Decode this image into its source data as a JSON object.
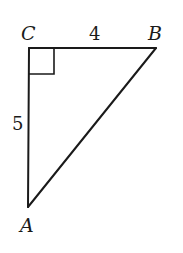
{
  "figure": {
    "type": "right-triangle",
    "colors": {
      "stroke": "#1a1a1a",
      "background": "#ffffff"
    },
    "vertices": {
      "C": {
        "label": "C",
        "x": 29,
        "y": 48
      },
      "B": {
        "label": "B",
        "x": 156,
        "y": 48
      },
      "A": {
        "label": "A",
        "x": 28,
        "y": 207
      }
    },
    "sides": {
      "CB": {
        "label": "4"
      },
      "CA": {
        "label": "5"
      }
    },
    "right_angle_at": "C"
  }
}
